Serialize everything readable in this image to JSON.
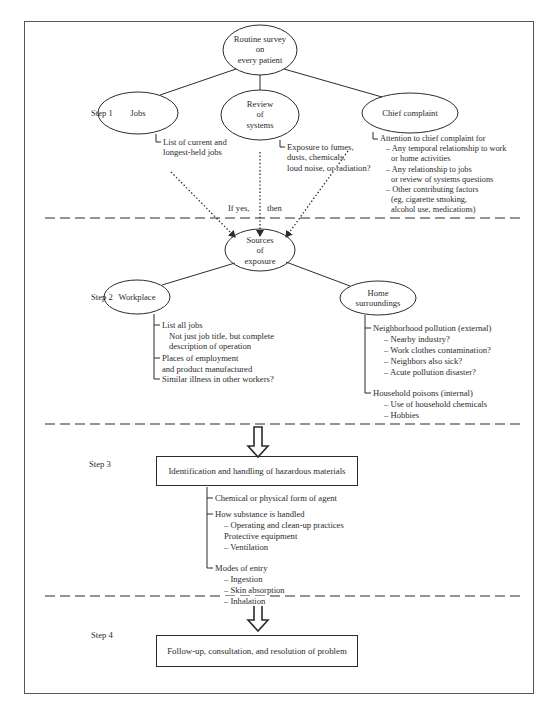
{
  "diagram": {
    "steps": [
      "Step 1",
      "Step 2",
      "Step 3",
      "Step 4"
    ],
    "step1": {
      "root": [
        "Routine survey",
        "on",
        "every patient"
      ],
      "nodes": {
        "jobs": "Jobs",
        "review": [
          "Review",
          "of",
          "systems"
        ],
        "chief": "Chief complaint"
      },
      "jobs_detail": [
        "List of current and",
        "longest-held jobs"
      ],
      "review_detail": [
        "Exposure to fumes,",
        "dusts, chemicals,",
        "loud noise, or radiation?"
      ],
      "chief_detail": [
        "Attention to chief complaint for",
        "– Any temporal relationship to work",
        "or home activities",
        "– Any relationship to jobs",
        "or review of systems questions",
        "– Other contributing factors",
        "(eg, cigarette smoking,",
        "alcohol use, medications)"
      ],
      "if_yes": "If yes,",
      "then": "then"
    },
    "step2": {
      "root": [
        "Sources",
        "of",
        "exposure"
      ],
      "workplace": "Workplace",
      "home": [
        "Home",
        "surroundings"
      ],
      "workplace_detail": [
        "List all jobs",
        "Not just job title, but complete",
        "description of operation",
        "Places of employment",
        "and product manufactured",
        "Similar illness in other workers?"
      ],
      "home_detail": [
        "Neighborhood pollution (external)",
        "– Nearby industry?",
        "– Work clothes contamination?",
        "– Neighbors also sick?",
        "– Acute pollution disaster?",
        "Household poisons (internal)",
        "– Use of household chemicals",
        "– Hobbies"
      ]
    },
    "step3": {
      "box": "Identification and handling of hazardous materials",
      "detail": [
        "Chemical or physical form of agent",
        "How substance is handled",
        "– Operating and clean-up practices",
        "Protective equipment",
        "– Ventilation",
        "Modes of entry",
        "– Ingestion",
        "– Skin absorption",
        "– Inhalation"
      ]
    },
    "step4": {
      "box": "Follow-up, consultation, and resolution of problem"
    },
    "colors": {
      "ink": "#2b2b2b",
      "frame": "#555555",
      "background": "#ffffff"
    }
  }
}
